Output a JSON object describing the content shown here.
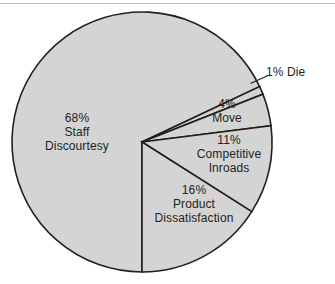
{
  "chart_data": {
    "type": "pie",
    "title": "",
    "subtitle": "",
    "xlabel": "",
    "ylabel": "",
    "legend_position": "none",
    "grid": false,
    "labels_inside": true,
    "unit": "%",
    "total": 100,
    "categories": [
      "Staff Discourtesy",
      "Die",
      "Move",
      "Competitive Inroads",
      "Product Dissatisfaction"
    ],
    "values": [
      68,
      1,
      4,
      11,
      16
    ],
    "slices": [
      {
        "name": "Staff Discourtesy",
        "percent_text": "68%",
        "value": 68,
        "label_line1": "68%",
        "label_line2": "Staff",
        "label_line3": "Discourtesy",
        "label_placement": "inside",
        "fill": "#d4d4d4",
        "stroke": "#231f20",
        "start_angle_deg": 180,
        "end_angle_deg": 424.8
      },
      {
        "name": "Die",
        "percent_text": "1%",
        "value": 1,
        "label_line1": "1% Die",
        "label_line2": "",
        "label_line3": "",
        "label_placement": "outside-leader",
        "fill": "#d4d4d4",
        "stroke": "#231f20",
        "start_angle_deg": 424.8,
        "end_angle_deg": 428.4
      },
      {
        "name": "Move",
        "percent_text": "4%",
        "value": 4,
        "label_line1": "4%",
        "label_line2": "Move",
        "label_line3": "",
        "label_placement": "inside",
        "fill": "#d4d4d4",
        "stroke": "#231f20",
        "start_angle_deg": 428.4,
        "end_angle_deg": 442.8
      },
      {
        "name": "Competitive Inroads",
        "percent_text": "11%",
        "value": 11,
        "label_line1": "11%",
        "label_line2": "Competitive",
        "label_line3": "Inroads",
        "label_placement": "inside",
        "fill": "#d4d4d4",
        "stroke": "#231f20",
        "start_angle_deg": 442.8,
        "end_angle_deg": 482.4
      },
      {
        "name": "Product Dissatisfaction",
        "percent_text": "16%",
        "value": 16,
        "label_line1": "16%",
        "label_line2": "Product",
        "label_line3": "Dissatisfaction",
        "label_placement": "inside",
        "fill": "#d4d4d4",
        "stroke": "#231f20",
        "start_angle_deg": 482.4,
        "end_angle_deg": 540
      }
    ],
    "colors": {
      "slice_fill": "#d4d4d4",
      "slice_stroke": "#231f20",
      "background": "#ffffff",
      "text": "#231f20",
      "top_rule": "#bcbcbc",
      "leader_line": "#231f20"
    },
    "geometry": {
      "center_x": 142,
      "center_y": 142,
      "radius": 130
    }
  }
}
